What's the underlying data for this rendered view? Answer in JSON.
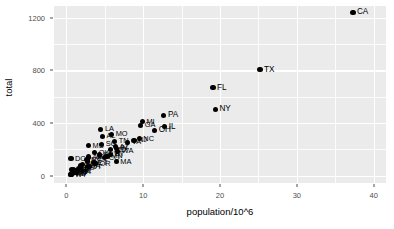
{
  "chart_data": {
    "type": "scatter",
    "title": "",
    "xlabel": "population/10^6",
    "ylabel": "total",
    "xlim": [
      -1.6,
      41.6
    ],
    "ylim": [
      -55,
      1290
    ],
    "xticks": [
      0,
      10,
      20,
      30,
      40
    ],
    "xticklabels": [
      "0",
      "10",
      "20",
      "30",
      "40"
    ],
    "yticks": [
      0,
      400,
      800,
      1200
    ],
    "yticklabels": [
      "0",
      "400",
      "800",
      "1200"
    ],
    "grid": true,
    "minor_grid": true,
    "legend": "none",
    "panel_bg": "#ebebeb",
    "grid_color": "#ffffff",
    "point_color": "#000000",
    "points": [
      {
        "label": "CA",
        "x": 37.3,
        "y": 1241
      },
      {
        "label": "TX",
        "x": 25.2,
        "y": 805
      },
      {
        "label": "FL",
        "x": 19.1,
        "y": 670
      },
      {
        "label": "NY",
        "x": 19.4,
        "y": 505
      },
      {
        "label": "PA",
        "x": 12.7,
        "y": 461
      },
      {
        "label": "MI",
        "x": 9.9,
        "y": 410
      },
      {
        "label": "GA",
        "x": 9.7,
        "y": 383
      },
      {
        "label": "IL",
        "x": 12.8,
        "y": 374
      },
      {
        "label": "LA",
        "x": 4.5,
        "y": 352
      },
      {
        "label": "OH",
        "x": 11.5,
        "y": 344
      },
      {
        "label": "MO",
        "x": 5.9,
        "y": 314
      },
      {
        "label": "AL",
        "x": 4.7,
        "y": 301
      },
      {
        "label": "NC",
        "x": 9.5,
        "y": 281
      },
      {
        "label": "NJ",
        "x": 8.8,
        "y": 270
      },
      {
        "label": "TN",
        "x": 6.3,
        "y": 262
      },
      {
        "label": "VA",
        "x": 8.0,
        "y": 253
      },
      {
        "label": "SC",
        "x": 4.6,
        "y": 240
      },
      {
        "label": "MS",
        "x": 2.9,
        "y": 228
      },
      {
        "label": "AZ",
        "x": 6.4,
        "y": 221
      },
      {
        "label": "IN",
        "x": 6.5,
        "y": 208
      },
      {
        "label": "MD",
        "x": 5.8,
        "y": 198
      },
      {
        "label": "WA",
        "x": 6.7,
        "y": 185
      },
      {
        "label": "OK",
        "x": 3.7,
        "y": 176
      },
      {
        "label": "WI",
        "x": 5.7,
        "y": 164
      },
      {
        "label": "KY",
        "x": 4.3,
        "y": 158
      },
      {
        "label": "MN",
        "x": 5.3,
        "y": 148
      },
      {
        "label": "AR",
        "x": 2.9,
        "y": 143
      },
      {
        "label": "CO",
        "x": 5.0,
        "y": 136
      },
      {
        "label": "DC",
        "x": 0.6,
        "y": 131
      },
      {
        "label": "NV",
        "x": 2.7,
        "y": 122
      },
      {
        "label": "KS",
        "x": 2.8,
        "y": 112
      },
      {
        "label": "MA",
        "x": 6.5,
        "y": 106
      },
      {
        "label": "CT",
        "x": 3.6,
        "y": 98
      },
      {
        "label": "OR",
        "x": 3.8,
        "y": 92
      },
      {
        "label": "NM",
        "x": 2.1,
        "y": 86
      },
      {
        "label": "WV",
        "x": 1.9,
        "y": 80
      },
      {
        "label": "IA",
        "x": 3.0,
        "y": 73
      },
      {
        "label": "UT",
        "x": 2.8,
        "y": 68
      },
      {
        "label": "NE",
        "x": 1.8,
        "y": 62
      },
      {
        "label": "ID",
        "x": 1.6,
        "y": 54
      },
      {
        "label": "AK",
        "x": 0.7,
        "y": 47
      },
      {
        "label": "DE",
        "x": 0.9,
        "y": 44
      },
      {
        "label": "HI",
        "x": 1.4,
        "y": 40
      },
      {
        "label": "ME",
        "x": 1.3,
        "y": 36
      },
      {
        "label": "MT",
        "x": 1.0,
        "y": 32
      },
      {
        "label": "NH",
        "x": 1.3,
        "y": 28
      },
      {
        "label": "RI",
        "x": 1.1,
        "y": 25
      },
      {
        "label": "SD",
        "x": 0.8,
        "y": 21
      },
      {
        "label": "ND",
        "x": 0.7,
        "y": 16
      },
      {
        "label": "VT",
        "x": 0.6,
        "y": 12
      },
      {
        "label": "WY",
        "x": 0.6,
        "y": 9
      }
    ]
  }
}
